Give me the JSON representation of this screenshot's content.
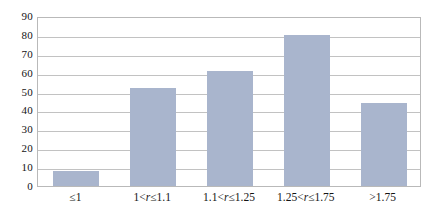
{
  "chart_data": {
    "type": "bar",
    "title": "",
    "subtitle": "",
    "xlabel": "",
    "ylabel": "",
    "categories": [
      "≤1",
      "1<r≤1.1",
      "1.1<r≤1.25",
      "1.25<r≤1.75",
      ">1.75"
    ],
    "category_parts": [
      {
        "pre": "≤1",
        "var": "",
        "post": ""
      },
      {
        "pre": "1<",
        "var": "r",
        "post": "≤1.1"
      },
      {
        "pre": "1.1<",
        "var": "r",
        "post": "≤1.25"
      },
      {
        "pre": "1.25<",
        "var": "r",
        "post": "≤1.75"
      },
      {
        "pre": ">1.75",
        "var": "",
        "post": ""
      }
    ],
    "values": [
      8,
      52,
      61,
      80,
      44
    ],
    "ylim": [
      0,
      90
    ],
    "ytick_step": 10,
    "yticks": [
      "0",
      "10",
      "20",
      "30",
      "40",
      "50",
      "60",
      "70",
      "80",
      "90"
    ],
    "grid": true,
    "grid_axis": "y",
    "legend": false,
    "legend_position": "none",
    "bar_color": "#a9b5cd",
    "grid_color": "#c2c2c2",
    "frame_color": "#b9b9b9",
    "text_color": "#141414",
    "background": "#ffffff"
  }
}
